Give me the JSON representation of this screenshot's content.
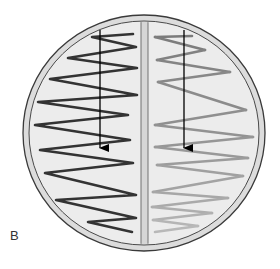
{
  "figure": {
    "panel_label": "B",
    "colors": {
      "background": "#ffffff",
      "dish_fill": "#ececec",
      "rim_band": "#dcdcdc",
      "rim_line": "#3a3a3a",
      "divider_fill": "#d6d6d6",
      "left_streak": "#333333",
      "right_streak_start": "#7a7a7a",
      "right_streak_end": "#b8b8b8",
      "arrow": "#000000"
    },
    "dish": {
      "cx": 144,
      "cy": 133,
      "rx": 121,
      "ry": 118
    },
    "divider": {
      "x1": 141,
      "x2": 148
    },
    "left_streak": {
      "points": [
        [
          133,
          34
        ],
        [
          92,
          37
        ],
        [
          136,
          47
        ],
        [
          68,
          58
        ],
        [
          137,
          68
        ],
        [
          50,
          79
        ],
        [
          137,
          95
        ],
        [
          38,
          102
        ],
        [
          128,
          115
        ],
        [
          35,
          125
        ],
        [
          130,
          140
        ],
        [
          40,
          150
        ],
        [
          133,
          163
        ],
        [
          45,
          173
        ],
        [
          136,
          195
        ],
        [
          56,
          200
        ],
        [
          136,
          218
        ],
        [
          88,
          222
        ],
        [
          132,
          232
        ]
      ]
    },
    "right_streak": {
      "points": [
        [
          192,
          36
        ],
        [
          155,
          37
        ],
        [
          205,
          50
        ],
        [
          157,
          60
        ],
        [
          230,
          72
        ],
        [
          158,
          82
        ],
        [
          246,
          110
        ],
        [
          155,
          125
        ],
        [
          253,
          137
        ],
        [
          155,
          147
        ],
        [
          248,
          158
        ],
        [
          157,
          165
        ],
        [
          243,
          176
        ],
        [
          153,
          192
        ],
        [
          228,
          198
        ],
        [
          152,
          207
        ],
        [
          212,
          213
        ],
        [
          153,
          220
        ],
        [
          198,
          226
        ],
        [
          155,
          232
        ]
      ]
    },
    "arrows": [
      {
        "name": "left-arrow",
        "x": 100,
        "y1": 30,
        "y2": 148
      },
      {
        "name": "right-arrow",
        "x": 184,
        "y1": 30,
        "y2": 148
      }
    ]
  }
}
